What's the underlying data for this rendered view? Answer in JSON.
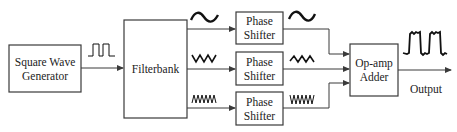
{
  "diagram": {
    "blocks": {
      "generator": {
        "line1": "Square Wave",
        "line2": "Generator"
      },
      "filterbank": {
        "label": "Filterbank"
      },
      "phase_shifters": [
        {
          "line1": "Phase",
          "line2": "Shifter"
        },
        {
          "line1": "Phase",
          "line2": "Shifter"
        },
        {
          "line1": "Phase",
          "line2": "Shifter"
        }
      ],
      "adder": {
        "line1": "Op-amp",
        "line2": "Adder"
      }
    },
    "output_label": "Output",
    "signals": [
      {
        "name": "square-wave-input",
        "shape": "square"
      },
      {
        "name": "fundamental",
        "shape": "sine-low-frequency"
      },
      {
        "name": "third-harmonic",
        "shape": "sine-mid-frequency"
      },
      {
        "name": "fifth-harmonic",
        "shape": "sine-high-frequency"
      },
      {
        "name": "output",
        "shape": "approximate-square"
      }
    ],
    "colors": {
      "stroke": "#3a3a3a",
      "text": "#222222",
      "background": "#ffffff"
    }
  }
}
